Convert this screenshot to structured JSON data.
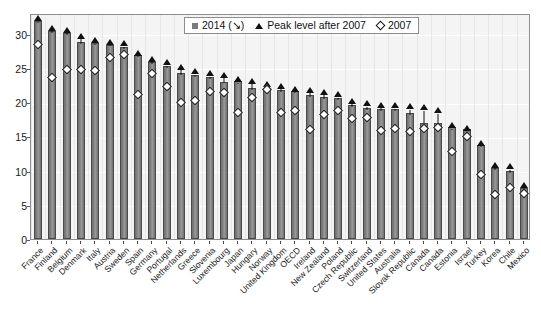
{
  "chart_data": {
    "type": "bar",
    "title": "",
    "subtitle": "",
    "xlabel": "",
    "ylabel": "",
    "ylim": [
      0,
      33
    ],
    "yticks": [
      0,
      5,
      10,
      15,
      20,
      25,
      30
    ],
    "grid": true,
    "legend_position": "top-center",
    "categories": [
      "France",
      "Finland",
      "Belgium",
      "Denmark",
      "Italy",
      "Austria",
      "Sweden",
      "Spain",
      "Germany",
      "Portugal",
      "Netherlands",
      "Greece",
      "Slovenia",
      "Luxembourg",
      "Japan",
      "Hungary",
      "Norway",
      "United Kingdom",
      "OECD",
      "Ireland",
      "New Zealand",
      "Poland",
      "Czech Republic",
      "Switzerland",
      "United States",
      "Australia",
      "Slovak Republic",
      "Canada",
      "Canada",
      "Estonia",
      "Israel",
      "Turkey",
      "Korea",
      "Chile",
      "Mexico"
    ],
    "series": [
      {
        "name": "2014 (↘)",
        "marker": "square",
        "values": [
          31.9,
          30.4,
          30.1,
          28.8,
          28.6,
          28.4,
          28.1,
          26.8,
          25.8,
          25.2,
          24.2,
          24.0,
          23.7,
          23.0,
          23.1,
          22.1,
          22.0,
          21.7,
          21.6,
          21.0,
          20.8,
          20.6,
          19.5,
          19.2,
          19.0,
          19.0,
          18.4,
          17.0,
          16.9,
          16.3,
          16.0,
          13.7,
          10.4,
          10.0,
          7.4
        ]
      },
      {
        "name": "Peak level after 2007",
        "marker": "triangle",
        "values": [
          32.0,
          30.6,
          30.3,
          29.5,
          28.8,
          28.6,
          28.4,
          27.0,
          26.1,
          25.6,
          24.9,
          24.3,
          24.0,
          23.8,
          23.1,
          22.9,
          22.5,
          22.2,
          21.7,
          21.6,
          21.3,
          20.9,
          20.0,
          19.6,
          19.4,
          19.3,
          19.2,
          19.0,
          18.6,
          16.4,
          16.0,
          13.8,
          10.6,
          10.4,
          7.7
        ]
      },
      {
        "name": "2007",
        "marker": "diamond",
        "values": [
          28.7,
          23.9,
          25.1,
          25.0,
          24.9,
          26.8,
          27.3,
          21.4,
          24.5,
          22.5,
          20.2,
          20.5,
          21.8,
          21.7,
          18.8,
          21.0,
          22.1,
          18.7,
          19.1,
          16.3,
          18.5,
          19.1,
          17.9,
          18.1,
          16.2,
          16.5,
          16.0,
          16.5,
          16.6,
          13.0,
          15.3,
          9.7,
          6.8,
          7.8,
          7.0
        ]
      }
    ],
    "legend": [
      {
        "label": "2014 (↘)",
        "marker": "square"
      },
      {
        "label": "Peak level after 2007",
        "marker": "triangle"
      },
      {
        "label": "2007",
        "marker": "diamond"
      }
    ],
    "colors": {
      "bar_fill": "#7a7a7a",
      "bar_edge": "#4a4a4a",
      "marker": "#111111",
      "diamond_fill": "#ffffff",
      "plot_background": "#f4f4f4",
      "gridline": "#ffffff",
      "axis": "#8d8d8d"
    }
  }
}
